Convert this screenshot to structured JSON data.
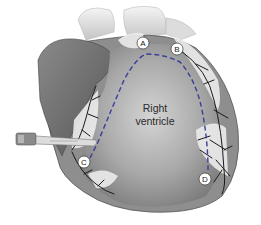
{
  "diagram": {
    "region_label_line1": "Right",
    "region_label_line2": "ventricle",
    "markers": [
      {
        "id": "A",
        "label": "A",
        "x": 143,
        "y": 43
      },
      {
        "id": "B",
        "label": "B",
        "x": 177,
        "y": 49
      },
      {
        "id": "C",
        "label": "C",
        "x": 84,
        "y": 162
      },
      {
        "id": "D",
        "label": "D",
        "x": 205,
        "y": 179
      }
    ],
    "incision_line": {
      "style": "dashed",
      "color": "#3a3f9a",
      "path_through": [
        "C",
        "A",
        "D"
      ]
    },
    "instrument": "scalpel",
    "colors": {
      "background": "#ffffff",
      "heart_shade": "#9a9a9a",
      "atrium_dark": "#6e6e6e",
      "fat": "#e6e6e6",
      "vessels": "#1a1a1a",
      "dashed_line": "#3a3f9a"
    }
  }
}
